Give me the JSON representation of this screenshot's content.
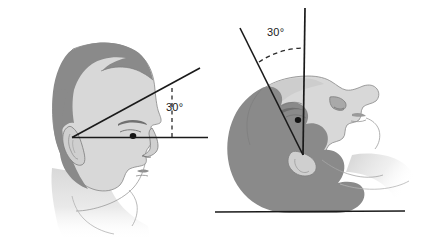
{
  "figure": {
    "background_color": "#ffffff",
    "width": 423,
    "height": 239,
    "palette": {
      "hair_gray": "#8a8a8a",
      "face_light_gray": "#d8d8d8",
      "face_mid_gray": "#c9c9c9",
      "outline": "#6f6f6f",
      "line_black": "#1a1a1a",
      "pupil_black": "#141414",
      "eyebrow_gray": "#707070"
    }
  },
  "panels": [
    {
      "id": "upright-profile",
      "name": "upright-head-profile",
      "orientation": "upright",
      "view": "lateral profile facing right",
      "angle_label": "30°",
      "angle_value": 30,
      "angle_unit": "degrees",
      "vertex": "external ear canal",
      "reference_line": "horizontal baseline",
      "angled_line": "30 degree elevated line",
      "dashed_line": "vertical dashed reference"
    },
    {
      "id": "supine-reclined",
      "name": "supine-head-reclined",
      "orientation": "supine",
      "view": "head tilted back, face upward",
      "angle_label": "30°",
      "angle_value": 30,
      "angle_unit": "degrees",
      "vertex": "external ear canal",
      "reference_line": "vertical reference line",
      "angled_line": "30 degree tilted line",
      "dashed_line": "dashed arc between lines",
      "support_surface": "horizontal table line"
    }
  ]
}
